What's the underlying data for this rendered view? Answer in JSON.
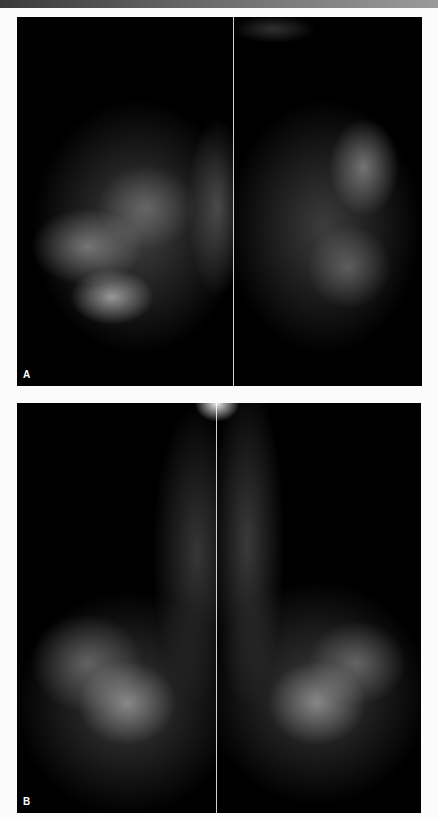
{
  "figure": {
    "panels": [
      {
        "id": "A",
        "label": "A",
        "description": "Bilateral mammogram, craniocaudal views, left and right breasts side by side"
      },
      {
        "id": "B",
        "label": "B",
        "description": "Bilateral mammogram, mediolateral oblique views, left and right breasts side by side"
      }
    ],
    "colors": {
      "background": "#fbfbfb",
      "panel": "#000000",
      "label": "#ffffff"
    }
  }
}
